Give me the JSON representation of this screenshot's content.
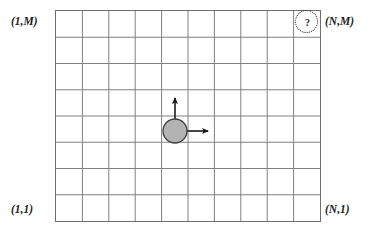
{
  "figure": {
    "background_color": "#ffffff"
  },
  "grid": {
    "columns": 10,
    "rows": 8,
    "line_color": "#808080",
    "border_color": "#6e6e6e",
    "cell_fill": "#ffffff",
    "left": 55,
    "top": 10,
    "width": 266,
    "height": 212
  },
  "corner_labels": {
    "top_left": "(1,M)",
    "top_right": "(N,M)",
    "bottom_left": "(1,1)",
    "bottom_right": "(N,1)"
  },
  "agent": {
    "shape": "circle",
    "fill_color": "#b3b3b3",
    "stroke_color": "#404040",
    "center_x": 175,
    "center_y": 131,
    "radius": 12,
    "arrows": [
      {
        "name": "up-arrow",
        "direction": "up",
        "length": 24
      },
      {
        "name": "right-arrow",
        "direction": "right",
        "length": 23
      }
    ]
  },
  "goal": {
    "symbol": "?",
    "outline_style": "dotted",
    "outline_color": "#2a2a2a",
    "cell_column": 10,
    "cell_row": 8,
    "center_x": 307,
    "center_y": 22
  }
}
